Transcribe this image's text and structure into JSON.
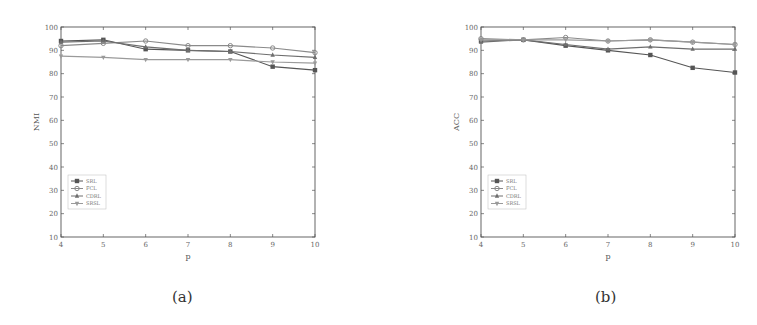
{
  "figure": {
    "captions": [
      "(a)",
      "(b)"
    ]
  },
  "chart_data": [
    {
      "type": "line",
      "title": "",
      "xlabel": "p",
      "ylabel": "NMI",
      "x": [
        4,
        5,
        6,
        7,
        8,
        9,
        10
      ],
      "xticks": [
        "4",
        "5",
        "6",
        "7",
        "8",
        "9",
        "10"
      ],
      "yticks": [
        "10",
        "20",
        "30",
        "40",
        "50",
        "60",
        "70",
        "80",
        "90",
        "100"
      ],
      "ylim": [
        10,
        100
      ],
      "xlim": [
        4,
        10
      ],
      "grid": false,
      "legend_position": "lower left",
      "series": [
        {
          "name": "SRL",
          "marker": "square",
          "values": [
            94,
            94.5,
            90.5,
            90,
            89.5,
            83,
            81.5
          ]
        },
        {
          "name": "FCL",
          "marker": "circle",
          "values": [
            92,
            93,
            94,
            92,
            92,
            91,
            89
          ]
        },
        {
          "name": "CDRL",
          "marker": "triangle-up",
          "values": [
            93.5,
            94,
            91.5,
            90,
            89.5,
            88,
            87
          ]
        },
        {
          "name": "SRSL",
          "marker": "triangle-down",
          "values": [
            87.5,
            87,
            86,
            86,
            86,
            85,
            84.5
          ]
        }
      ],
      "caption": "(a)"
    },
    {
      "type": "line",
      "title": "",
      "xlabel": "p",
      "ylabel": "ACC",
      "x": [
        4,
        5,
        6,
        7,
        8,
        9,
        10
      ],
      "xticks": [
        "4",
        "5",
        "6",
        "7",
        "8",
        "9",
        "10"
      ],
      "yticks": [
        "10",
        "20",
        "30",
        "40",
        "50",
        "60",
        "70",
        "80",
        "90",
        "100"
      ],
      "ylim": [
        10,
        100
      ],
      "xlim": [
        4,
        10
      ],
      "grid": false,
      "legend_position": "lower left",
      "series": [
        {
          "name": "SRL",
          "marker": "square",
          "values": [
            94,
            94.5,
            92,
            90,
            88,
            82.5,
            80.5
          ]
        },
        {
          "name": "FCL",
          "marker": "circle",
          "values": [
            95,
            94.5,
            95.5,
            94,
            94.5,
            93.5,
            92.5
          ]
        },
        {
          "name": "CDRL",
          "marker": "triangle-up",
          "values": [
            93.5,
            94.5,
            92.5,
            90.5,
            91.5,
            90.5,
            90.5
          ]
        },
        {
          "name": "SRSL",
          "marker": "triangle-down",
          "values": [
            94.5,
            94.5,
            94.5,
            94,
            94.5,
            93.5,
            92.5
          ]
        }
      ],
      "caption": "(b)"
    }
  ],
  "colors": {
    "axis": "#555555",
    "series": [
      "#555555",
      "#8a8a8a",
      "#6e6e6e",
      "#9a9a9a"
    ]
  }
}
